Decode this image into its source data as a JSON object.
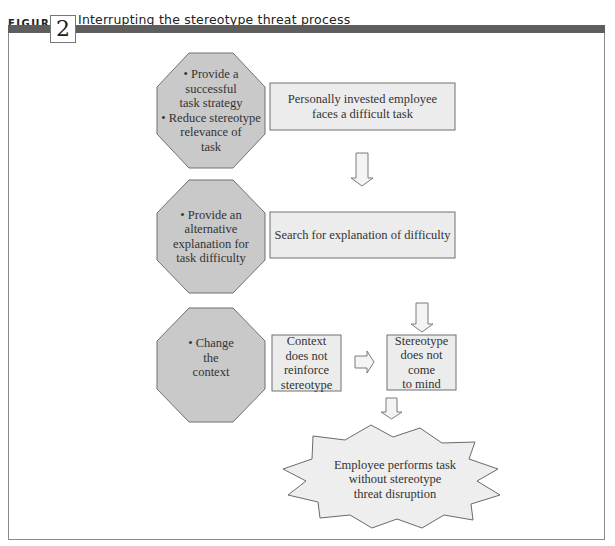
{
  "figure": {
    "label": "FIGURE",
    "number": "2",
    "title": "Interrupting the stereotype threat process"
  },
  "colors": {
    "band": "#5e5e5e",
    "octagon_fill": "#c9c9c9",
    "box_fill": "#ececec",
    "starburst_fill": "#eeeeee",
    "stroke": "#707070"
  },
  "interventions": [
    {
      "text": "• Provide a successful task strategy • Reduce stereotype relevance of task",
      "lines": [
        "• Provide a",
        "successful",
        "task strategy",
        "• Reduce stereotype",
        "relevance of",
        "task"
      ]
    },
    {
      "text": "• Provide an alternative explanation for task difficulty",
      "lines": [
        "• Provide an",
        "alternative",
        "explanation for",
        "task difficulty"
      ]
    },
    {
      "text": "• Change the context",
      "lines": [
        "• Change",
        "the",
        "context"
      ]
    }
  ],
  "process": {
    "step1": {
      "lines": [
        "Personally invested employee",
        "faces a difficult task"
      ]
    },
    "step2": {
      "lines": [
        "Search for explanation of difficulty"
      ]
    },
    "step3a": {
      "lines": [
        "Context",
        "does not",
        "reinforce",
        "stereotype"
      ]
    },
    "step3b": {
      "lines": [
        "Stereotype",
        "does not",
        "come",
        "to mind"
      ]
    },
    "outcome": {
      "lines": [
        "Employee performs task",
        "without stereotype",
        "threat disruption"
      ]
    }
  },
  "arrows": [
    {
      "from": "step1",
      "to": "step2",
      "direction": "down"
    },
    {
      "from": "step2",
      "to": "step3b",
      "direction": "down"
    },
    {
      "from": "step3a",
      "to": "step3b",
      "direction": "right"
    },
    {
      "from": "step3b",
      "to": "outcome",
      "direction": "down"
    }
  ]
}
